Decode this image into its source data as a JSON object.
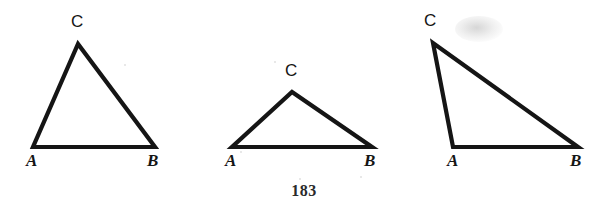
{
  "page": {
    "background_color": "#ffffff",
    "ink_color": "#151515",
    "page_number": "183",
    "width": 608,
    "height": 213
  },
  "figure": {
    "caption": "",
    "stroke_width": 4.2,
    "stroke_color": "#151515",
    "triangles": [
      {
        "name": "triangle-1-acute",
        "description": "tall acute triangle",
        "vertices": {
          "A": {
            "x": 33,
            "y": 147
          },
          "B": {
            "x": 155,
            "y": 147
          },
          "C": {
            "x": 78,
            "y": 44
          }
        },
        "labels": {
          "A": {
            "text": "A",
            "x": 26,
            "y": 152,
            "style": "italic-serif"
          },
          "B": {
            "text": "B",
            "x": 147,
            "y": 152,
            "style": "italic-serif"
          },
          "C": {
            "text": "C",
            "x": 71,
            "y": 13,
            "style": "upright-sans"
          }
        }
      },
      {
        "name": "triangle-2-flat",
        "description": "wide flat obtuse triangle",
        "vertices": {
          "A": {
            "x": 232,
            "y": 147
          },
          "B": {
            "x": 372,
            "y": 147
          },
          "C": {
            "x": 292,
            "y": 92
          }
        },
        "labels": {
          "A": {
            "text": "A",
            "x": 225,
            "y": 152,
            "style": "italic-serif"
          },
          "B": {
            "text": "B",
            "x": 364,
            "y": 152,
            "style": "italic-serif"
          },
          "C": {
            "text": "C",
            "x": 285,
            "y": 62,
            "style": "upright-sans"
          }
        }
      },
      {
        "name": "triangle-3-scalene",
        "description": "right-leaning scalene triangle with apex at upper left",
        "vertices": {
          "A": {
            "x": 453,
            "y": 147
          },
          "B": {
            "x": 578,
            "y": 147
          },
          "C": {
            "x": 433,
            "y": 43
          }
        },
        "labels": {
          "A": {
            "text": "A",
            "x": 447,
            "y": 152,
            "style": "italic-serif"
          },
          "B": {
            "text": "B",
            "x": 570,
            "y": 152,
            "style": "italic-serif"
          },
          "C": {
            "text": "C",
            "x": 424,
            "y": 12,
            "style": "upright-sans"
          }
        }
      }
    ],
    "scan_artifacts": [
      {
        "name": "smudge-top-right",
        "x": 455,
        "y": 16,
        "width": 48,
        "height": 26
      },
      {
        "name": "speck-upper-mid",
        "x": 274,
        "y": 61,
        "size": 2
      },
      {
        "name": "speck-lower-mid",
        "x": 299,
        "y": 178,
        "size": 2
      },
      {
        "name": "speck-left-mid",
        "x": 240,
        "y": 151,
        "size": 2
      },
      {
        "name": "speck-tri1-right",
        "x": 124,
        "y": 64,
        "size": 2
      },
      {
        "name": "speck-page-right",
        "x": 360,
        "y": 176,
        "size": 2
      }
    ]
  }
}
